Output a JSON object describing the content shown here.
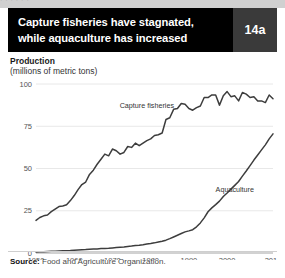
{
  "top_strip": {
    "ghost_text": "·      ·       ·      ·        ·      ·"
  },
  "header": {
    "title_line1": "Capture fisheries have stagnated,",
    "title_line2": "while aquaculture has increased",
    "badge": "14a",
    "bg_color": "#000000",
    "badge_bg_color": "#3a3a3a",
    "text_color": "#ffffff"
  },
  "axis_titles": {
    "title": "Production",
    "subtitle": "(millions of metric tons)"
  },
  "footer": {
    "source_label": "Source:",
    "source_text": " Food and Agriculture Organization."
  },
  "chart_data": {
    "type": "line",
    "title": "Capture fisheries have stagnated, while aquaculture has increased",
    "xlabel": "",
    "ylabel": "Production (millions of metric tons)",
    "xlim": [
      1950,
      2012
    ],
    "ylim": [
      0,
      100
    ],
    "yticks": [
      0,
      25,
      50,
      75,
      100
    ],
    "ytick_labels": [
      "0",
      "25",
      "50",
      "75",
      "100"
    ],
    "xticks": [
      1950,
      1960,
      1970,
      1980,
      1990,
      2000,
      2012
    ],
    "xtick_labels": [
      "1950",
      "1960",
      "1970",
      "1980",
      "1990",
      "2000",
      "2012"
    ],
    "grid": "horizontal",
    "legend": "inline-labels",
    "line_color": "#3d3d3d",
    "grid_color": "#e2e2e2",
    "x": [
      1950,
      1951,
      1952,
      1953,
      1954,
      1955,
      1956,
      1957,
      1958,
      1959,
      1960,
      1961,
      1962,
      1963,
      1964,
      1965,
      1966,
      1967,
      1968,
      1969,
      1970,
      1971,
      1972,
      1973,
      1974,
      1975,
      1976,
      1977,
      1978,
      1979,
      1980,
      1981,
      1982,
      1983,
      1984,
      1985,
      1986,
      1987,
      1988,
      1989,
      1990,
      1991,
      1992,
      1993,
      1994,
      1995,
      1996,
      1997,
      1998,
      1999,
      2000,
      2001,
      2002,
      2003,
      2004,
      2005,
      2006,
      2007,
      2008,
      2009,
      2010,
      2011,
      2012
    ],
    "series": [
      {
        "name": "Capture fisheries",
        "label": "Capture fisheries",
        "label_x": 1979,
        "label_y": 86,
        "values": [
          19.3,
          21.0,
          22.0,
          22.5,
          24.5,
          26.0,
          27.5,
          27.8,
          28.5,
          31.0,
          34.0,
          37.5,
          40.5,
          42.0,
          46.5,
          49.0,
          52.5,
          55.5,
          58.5,
          57.5,
          61.5,
          60.5,
          58.5,
          59.5,
          63.0,
          62.5,
          65.0,
          63.5,
          65.0,
          66.5,
          67.5,
          69.5,
          70.0,
          71.0,
          79.0,
          80.0,
          85.0,
          85.5,
          88.5,
          88.0,
          85.5,
          84.5,
          86.0,
          87.0,
          92.0,
          92.0,
          93.5,
          93.5,
          87.5,
          93.0,
          95.5,
          92.5,
          93.0,
          90.0,
          95.0,
          94.0,
          92.0,
          92.5,
          90.0,
          90.0,
          89.0,
          93.5,
          91.3
        ]
      },
      {
        "name": "Aquaculture",
        "label": "Aquaculture",
        "label_x": 2002,
        "label_y": 36,
        "values": [
          0.6,
          0.7,
          0.8,
          0.9,
          1.0,
          1.1,
          1.2,
          1.3,
          1.4,
          1.5,
          1.7,
          1.8,
          1.9,
          2.0,
          2.2,
          2.3,
          2.4,
          2.6,
          2.7,
          2.8,
          3.0,
          3.2,
          3.4,
          3.6,
          3.9,
          4.1,
          4.4,
          4.6,
          4.9,
          5.3,
          5.6,
          6.0,
          6.5,
          7.0,
          7.6,
          8.5,
          9.5,
          10.5,
          11.5,
          12.5,
          13.1,
          13.8,
          15.5,
          17.8,
          20.8,
          24.4,
          26.7,
          28.6,
          30.7,
          33.4,
          35.5,
          37.8,
          40.0,
          42.3,
          45.5,
          48.5,
          51.7,
          55.0,
          58.0,
          61.0,
          64.0,
          67.5,
          70.5
        ]
      }
    ]
  }
}
